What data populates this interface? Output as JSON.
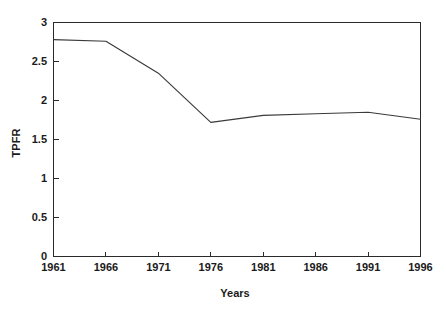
{
  "chart_data": {
    "type": "line",
    "title": "",
    "xlabel": "Years",
    "ylabel": "TPFR",
    "x": [
      1961,
      1966,
      1971,
      1976,
      1981,
      1986,
      1991,
      1996
    ],
    "values": [
      2.78,
      2.76,
      2.35,
      1.72,
      1.81,
      1.83,
      1.85,
      1.76
    ],
    "series": [
      {
        "name": "TPFR",
        "values": [
          2.78,
          2.76,
          2.35,
          1.72,
          1.81,
          1.83,
          1.85,
          1.76
        ]
      }
    ],
    "categories": [
      "1961",
      "1966",
      "1971",
      "1976",
      "1981",
      "1986",
      "1991",
      "1996"
    ],
    "xlim": [
      1961,
      1996
    ],
    "ylim": [
      0,
      3
    ],
    "xticks": [
      "1961",
      "1966",
      "1971",
      "1976",
      "1981",
      "1986",
      "1991",
      "1996"
    ],
    "yticks": [
      "0",
      "0.5",
      "1",
      "1.5",
      "2",
      "2.5",
      "3"
    ],
    "ytick_values": [
      0,
      0.5,
      1,
      1.5,
      2,
      2.5,
      3
    ],
    "grid": false,
    "legend": "none",
    "line_color": "#3a3a3a",
    "axis_color": "#2a2a2a",
    "background": "#ffffff"
  },
  "axes": {
    "y_title": "TPFR",
    "x_title": "Years"
  },
  "ytick_labels": {
    "t0": "0",
    "t1": "0.5",
    "t2": "1",
    "t3": "1.5",
    "t4": "2",
    "t5": "2.5",
    "t6": "3"
  },
  "xtick_labels": {
    "t0": "1961",
    "t1": "1966",
    "t2": "1971",
    "t3": "1976",
    "t4": "1981",
    "t5": "1986",
    "t6": "1991",
    "t7": "1996"
  }
}
